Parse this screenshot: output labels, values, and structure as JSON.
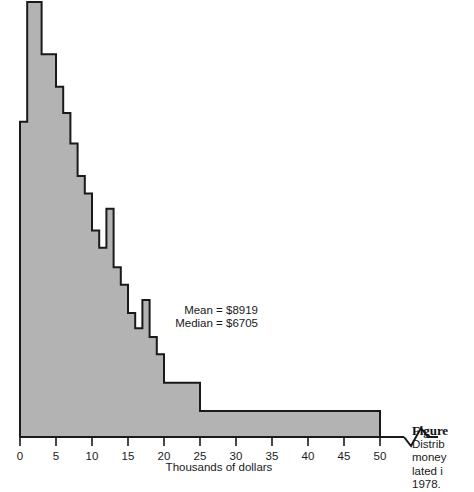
{
  "figure": {
    "caption_title": "Figure",
    "caption_lines": [
      "Distrib",
      "money",
      "lated i",
      "1978."
    ]
  },
  "chart_data": {
    "type": "bar",
    "title": "",
    "xlabel": "Thousands of dollars",
    "ylabel": "",
    "xlim": [
      0,
      55
    ],
    "ylim": [
      0,
      100
    ],
    "grid": false,
    "legend": null,
    "bin_width": 1,
    "annotations": [
      "Mean = $8919",
      "Median = $6705"
    ],
    "stats": {
      "mean_label": "Mean = $8919",
      "median_label": "Median = $6705",
      "mean": 8919,
      "median": 6705
    },
    "xticks": [
      0,
      5,
      10,
      15,
      20,
      25,
      30,
      35,
      40,
      45,
      50
    ],
    "xtick_labels": [
      "0",
      "5",
      "10",
      "15",
      "20",
      "25",
      "30",
      "35",
      "40",
      "45",
      "50"
    ],
    "axis_break": true,
    "axis_break_label": "zigzag-break",
    "colors": {
      "bar_fill": "#b3b3b3",
      "bar_edge": "#1a1a1a",
      "axis": "#1a1a1a",
      "text": "#1a1a1a"
    },
    "bins": [
      {
        "x0": 0,
        "x1": 1,
        "height": 72.5
      },
      {
        "x0": 1,
        "x1": 2,
        "height": 100.0
      },
      {
        "x0": 2,
        "x1": 3,
        "height": 100.0
      },
      {
        "x0": 3,
        "x1": 4,
        "height": 88.0
      },
      {
        "x0": 4,
        "x1": 5,
        "height": 88.0
      },
      {
        "x0": 5,
        "x1": 6,
        "height": 80.5
      },
      {
        "x0": 6,
        "x1": 7,
        "height": 74.5
      },
      {
        "x0": 7,
        "x1": 8,
        "height": 67.5
      },
      {
        "x0": 8,
        "x1": 9,
        "height": 60.0
      },
      {
        "x0": 9,
        "x1": 10,
        "height": 56.0
      },
      {
        "x0": 10,
        "x1": 11,
        "height": 47.5
      },
      {
        "x0": 11,
        "x1": 12,
        "height": 43.5
      },
      {
        "x0": 12,
        "x1": 13,
        "height": 52.5
      },
      {
        "x0": 13,
        "x1": 14,
        "height": 39.0
      },
      {
        "x0": 14,
        "x1": 15,
        "height": 35.0
      },
      {
        "x0": 15,
        "x1": 16,
        "height": 28.5
      },
      {
        "x0": 16,
        "x1": 17,
        "height": 25.0
      },
      {
        "x0": 17,
        "x1": 18,
        "height": 31.5
      },
      {
        "x0": 18,
        "x1": 19,
        "height": 23.0
      },
      {
        "x0": 19,
        "x1": 20,
        "height": 19.0
      },
      {
        "x0": 20,
        "x1": 25,
        "height": 12.5
      },
      {
        "x0": 25,
        "x1": 50,
        "height": 6.0
      },
      {
        "x0": 50,
        "x1": 55,
        "height": 0.0
      }
    ]
  }
}
